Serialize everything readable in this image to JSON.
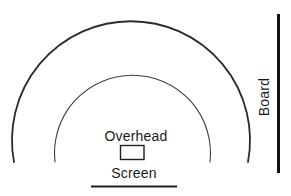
{
  "diagram": {
    "labels": {
      "overhead": "Overhead",
      "screen": "Screen",
      "board": "Board"
    },
    "colors": {
      "background": "#ffffff",
      "outer_arc": "#2b2b2b",
      "inner_arc": "#3f3f3f",
      "box_border": "#1f1f1f",
      "screen_line": "#1f1f1f",
      "board_line": "#111111",
      "text": "#1a1a1a"
    }
  }
}
